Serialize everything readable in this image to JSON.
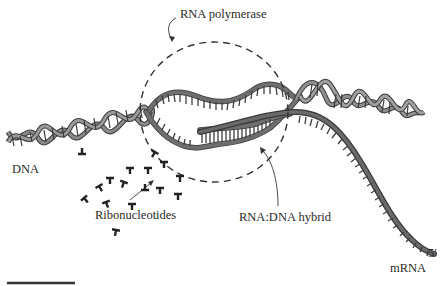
{
  "figure": {
    "type": "transcription-diagram",
    "labels": {
      "rna_polymerase": "RNA polymerase",
      "dna": "DNA",
      "ribonucleotides": "Ribonucleotides",
      "hybrid": "RNA:DNA hybrid",
      "five_prime": "5′",
      "mrna": "mRNA"
    },
    "colors": {
      "background": "#ffffff",
      "strand_fill": "#6e6e6e",
      "strand_outline": "#3a3a3a",
      "text": "#2a2a2a"
    },
    "elements": [
      {
        "name": "dna-double-helix-left",
        "description": "DNA double helix entering from lower left"
      },
      {
        "name": "transcription-bubble",
        "description": "unwound DNA strands inside dashed RNA polymerase outline"
      },
      {
        "name": "dna-double-helix-right",
        "description": "re-wound DNA helix exiting to the right"
      },
      {
        "name": "rna-dna-hybrid",
        "description": "short RNA:DNA hybrid region within the bubble"
      },
      {
        "name": "mrna-strand",
        "description": "newly synthesized mRNA exiting to lower right ending at 5' end"
      },
      {
        "name": "ribonucleotides",
        "description": "scattered T-shaped ribonucleotide glyphs entering polymerase"
      },
      {
        "name": "scale-bar",
        "description": "horizontal black bar at bottom left"
      }
    ]
  }
}
